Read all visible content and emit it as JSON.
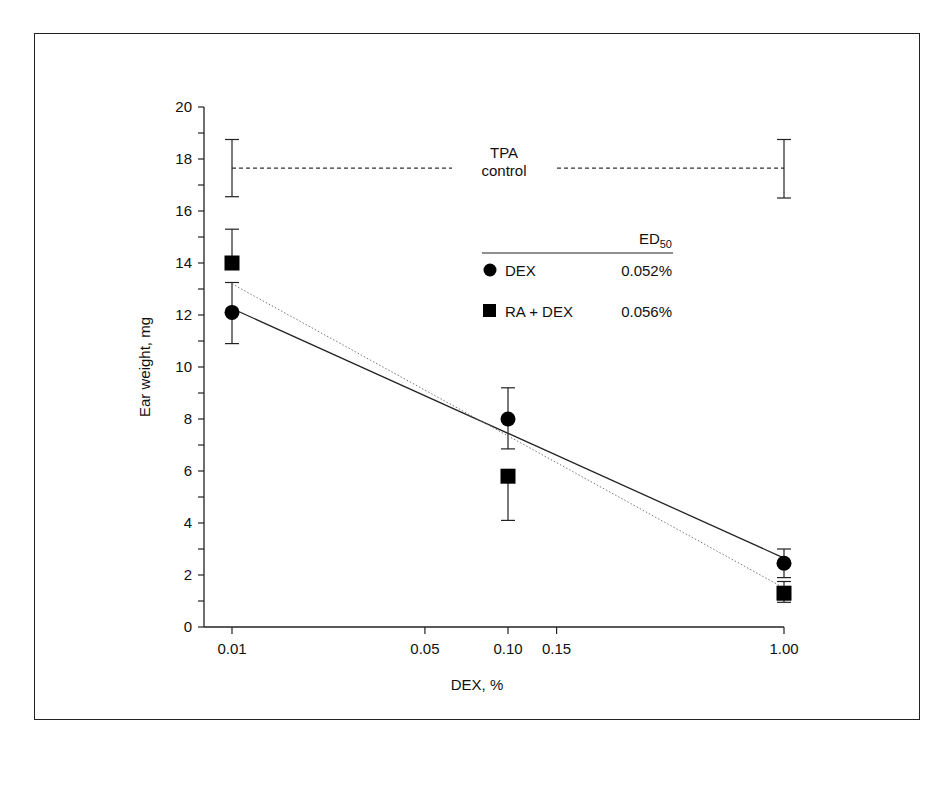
{
  "chart_data": {
    "type": "scatter",
    "title": "",
    "xlabel": "DEX, %",
    "ylabel": "Ear weight, mg",
    "xscale": "log",
    "xlim": [
      0.008,
      1.2
    ],
    "ylim": [
      0,
      20
    ],
    "x_ticks": [
      0.01,
      0.05,
      0.1,
      0.15,
      1.0
    ],
    "x_tick_labels": [
      "0.01",
      "0.05",
      "0.10",
      "0.15",
      "1.00"
    ],
    "y_ticks": [
      0,
      2,
      4,
      6,
      8,
      10,
      12,
      14,
      16,
      18,
      20
    ],
    "y_tick_labels": [
      "0",
      "2",
      "4",
      "6",
      "8",
      "10",
      "12",
      "14",
      "16",
      "18",
      "20"
    ],
    "grid": false,
    "legend_position": "upper right (inside plot)",
    "series": [
      {
        "name": "DEX",
        "marker": "circle",
        "x": [
          0.01,
          0.1,
          1.0
        ],
        "y": [
          12.1,
          8.0,
          2.45
        ],
        "err_low": [
          10.9,
          6.85,
          1.9
        ],
        "err_high": [
          13.25,
          9.2,
          3.0
        ],
        "fit_line": {
          "style": "solid",
          "x": [
            0.01,
            1.0
          ],
          "y": [
            12.25,
            2.65
          ]
        },
        "ED50": "0.052%"
      },
      {
        "name": "RA + DEX",
        "marker": "square",
        "x": [
          0.01,
          0.1,
          1.0
        ],
        "y": [
          14.0,
          5.8,
          1.3
        ],
        "err_low": [
          14.0,
          4.1,
          0.95
        ],
        "err_high": [
          15.3,
          5.8,
          1.75
        ],
        "fit_line": {
          "style": "dotted",
          "x": [
            0.01,
            1.0
          ],
          "y": [
            13.2,
            1.5
          ]
        },
        "ED50": "0.056%"
      },
      {
        "name": "TPA control",
        "marker": "none",
        "line_style": "dashed",
        "x": [
          0.01,
          1.0
        ],
        "y": [
          17.65,
          17.65
        ],
        "err_low": [
          16.55,
          16.5
        ],
        "err_high": [
          18.75,
          18.75
        ]
      }
    ],
    "annotations": [
      "TPA",
      "control"
    ],
    "legend": {
      "header": "ED50",
      "entries": [
        {
          "label": "DEX",
          "value": "0.052%"
        },
        {
          "label": "RA + DEX",
          "value": "0.056%"
        }
      ]
    }
  },
  "labels": {
    "xlabel": "DEX, %",
    "ylabel": "Ear weight, mg",
    "tpa_line1": "TPA",
    "tpa_line2": "control",
    "legend_header_main": "ED",
    "legend_header_sub": "50",
    "legend_dex": "DEX",
    "legend_dex_value": "0.052%",
    "legend_ra": "RA + DEX",
    "legend_ra_value": "0.056%"
  }
}
